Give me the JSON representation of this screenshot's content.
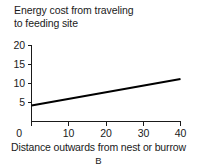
{
  "chart_data": {
    "type": "line",
    "title": "Energy cost from traveling\nto feeding site",
    "xlabel": "Distance outwards from nest or burrow",
    "ylabel": "",
    "panel_label": "B",
    "xlim": [
      0,
      40
    ],
    "ylim": [
      0,
      20
    ],
    "xticks": [
      0,
      10,
      20,
      30,
      40
    ],
    "xtick_labels": [
      "0",
      "10",
      "20",
      "30",
      "40"
    ],
    "yticks": [
      5,
      10,
      15,
      20
    ],
    "ytick_labels": [
      "5",
      "10",
      "15",
      "20"
    ],
    "grid": false,
    "legend": "none",
    "series": [
      {
        "name": "energy-cost",
        "color": "#000000",
        "x": [
          0,
          40
        ],
        "values": [
          4.2,
          11.2
        ]
      }
    ]
  },
  "figure": {
    "title_line1": "Energy cost from traveling",
    "title_line2": "to feeding site",
    "x_axis_caption": "Distance outwards from nest or burrow",
    "panel_letter": "B",
    "background_color": "#ffffff",
    "line_color": "#000000",
    "axis_color": "#1a1a1a"
  }
}
